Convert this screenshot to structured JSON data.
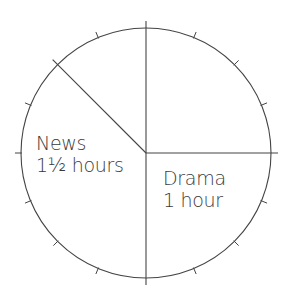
{
  "chart_data": {
    "type": "pie",
    "title": "",
    "unit": "hours",
    "total_hours": 4,
    "tick_interval_degrees": 22.5,
    "tick_interval_minutes": 15,
    "slices": [
      {
        "name": "News",
        "label": "News",
        "value_label": "1½ hours",
        "value": 1.5,
        "start_angle": 135,
        "end_angle": 270
      },
      {
        "name": "Drama",
        "label": "Drama",
        "value_label": "1 hour",
        "value": 1,
        "start_angle": 270,
        "end_angle": 360
      },
      {
        "name": "unlabeled-upper-right",
        "label": "",
        "value_label": "",
        "value": 1,
        "start_angle": 0,
        "end_angle": 90
      },
      {
        "name": "unlabeled-upper-left",
        "label": "",
        "value_label": "",
        "value": 0.5,
        "start_angle": 90,
        "end_angle": 135
      }
    ],
    "categories": [
      "News",
      "Drama",
      "(unlabeled)",
      "(unlabeled)"
    ],
    "values": [
      1.5,
      1,
      1,
      0.5
    ],
    "legend": "none",
    "grid": false
  },
  "style": {
    "line_color": "#444444",
    "background": "#ffffff",
    "text_color": "#3a3a3a"
  },
  "labels": {
    "news": {
      "title": "News",
      "value": "1½ hours"
    },
    "drama": {
      "title": "Drama",
      "value": "1 hour"
    }
  }
}
